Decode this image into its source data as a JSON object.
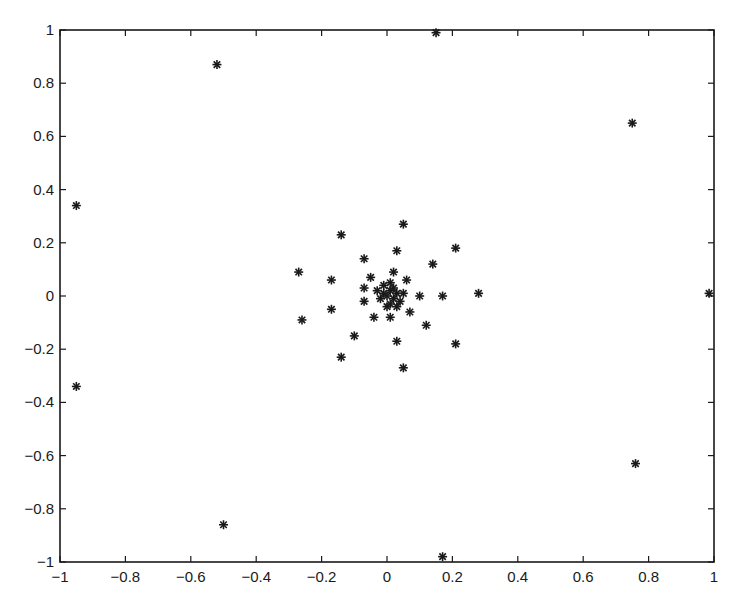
{
  "chart_data": {
    "type": "scatter",
    "title": "",
    "xlabel": "",
    "ylabel": "",
    "xlim": [
      -1,
      1
    ],
    "ylim": [
      -1,
      1
    ],
    "grid": false,
    "legend": null,
    "marker": "asterisk",
    "marker_color": "#1a1a1a",
    "x_ticks": [
      "-1",
      "-0.8",
      "-0.6",
      "-0.4",
      "-0.2",
      "0",
      "0.2",
      "0.4",
      "0.6",
      "0.8",
      "1"
    ],
    "y_ticks": [
      "1",
      "0.8",
      "0.6",
      "0.4",
      "0.2",
      "0",
      "-0.2",
      "-0.4",
      "-0.6",
      "-0.8",
      "-1"
    ],
    "points": [
      {
        "x": -0.52,
        "y": 0.87
      },
      {
        "x": 0.15,
        "y": 0.99
      },
      {
        "x": 0.75,
        "y": 0.65
      },
      {
        "x": -0.95,
        "y": 0.34
      },
      {
        "x": -0.95,
        "y": -0.34
      },
      {
        "x": 0.985,
        "y": 0.01
      },
      {
        "x": -0.5,
        "y": -0.86
      },
      {
        "x": 0.17,
        "y": -0.98
      },
      {
        "x": 0.76,
        "y": -0.63
      },
      {
        "x": 0.05,
        "y": 0.27
      },
      {
        "x": -0.14,
        "y": 0.23
      },
      {
        "x": 0.21,
        "y": 0.18
      },
      {
        "x": 0.03,
        "y": 0.17
      },
      {
        "x": -0.07,
        "y": 0.14
      },
      {
        "x": -0.27,
        "y": 0.09
      },
      {
        "x": 0.14,
        "y": 0.12
      },
      {
        "x": 0.02,
        "y": 0.09
      },
      {
        "x": -0.17,
        "y": 0.06
      },
      {
        "x": -0.05,
        "y": 0.07
      },
      {
        "x": 0.06,
        "y": 0.06
      },
      {
        "x": -0.07,
        "y": 0.03
      },
      {
        "x": 0.1,
        "y": 0.0
      },
      {
        "x": 0.17,
        "y": 0.0
      },
      {
        "x": 0.28,
        "y": 0.01
      },
      {
        "x": -0.07,
        "y": -0.02
      },
      {
        "x": -0.17,
        "y": -0.05
      },
      {
        "x": -0.26,
        "y": -0.09
      },
      {
        "x": -0.04,
        "y": -0.08
      },
      {
        "x": 0.01,
        "y": -0.08
      },
      {
        "x": 0.07,
        "y": -0.06
      },
      {
        "x": 0.12,
        "y": -0.11
      },
      {
        "x": -0.1,
        "y": -0.15
      },
      {
        "x": 0.03,
        "y": -0.17
      },
      {
        "x": 0.21,
        "y": -0.18
      },
      {
        "x": -0.14,
        "y": -0.23
      },
      {
        "x": 0.05,
        "y": -0.27
      },
      {
        "x": 0.0,
        "y": 0.0
      },
      {
        "x": 0.01,
        "y": 0.02
      },
      {
        "x": 0.02,
        "y": -0.01
      },
      {
        "x": -0.01,
        "y": 0.01
      },
      {
        "x": 0.03,
        "y": 0.01
      },
      {
        "x": 0.01,
        "y": -0.03
      },
      {
        "x": -0.02,
        "y": -0.01
      },
      {
        "x": 0.02,
        "y": 0.03
      },
      {
        "x": 0.04,
        "y": -0.02
      },
      {
        "x": 0.0,
        "y": -0.04
      },
      {
        "x": -0.01,
        "y": 0.04
      },
      {
        "x": 0.03,
        "y": -0.04
      },
      {
        "x": 0.05,
        "y": 0.01
      },
      {
        "x": -0.03,
        "y": 0.02
      },
      {
        "x": 0.01,
        "y": 0.05
      }
    ]
  }
}
